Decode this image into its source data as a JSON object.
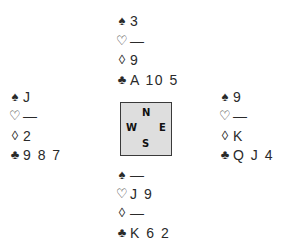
{
  "hands": {
    "north": {
      "spades": "3",
      "hearts": "—",
      "diamonds": "9",
      "clubs": "A 10 5"
    },
    "west": {
      "spades": "J",
      "hearts": "—",
      "diamonds": "2",
      "clubs": "9 8 7"
    },
    "east": {
      "spades": "9",
      "hearts": "—",
      "diamonds": "K",
      "clubs": "Q J 4"
    },
    "south": {
      "spades": "—",
      "hearts": "J 9",
      "diamonds": "—",
      "clubs": "K 6 2"
    }
  },
  "suits": {
    "spades": "♠",
    "hearts": "♡",
    "diamonds": "◊",
    "clubs": "♣"
  },
  "compass": {
    "n": "N",
    "s": "S",
    "w": "W",
    "e": "E"
  }
}
